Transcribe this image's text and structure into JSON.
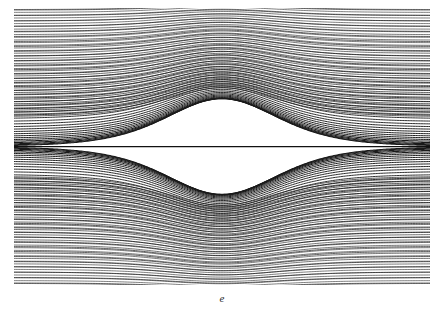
{
  "figure": {
    "caption": "e",
    "kind": "contour-streamline-plot",
    "background_color": "#ffffff",
    "line_color": "#1a1a1a",
    "plot_box": {
      "x": 14,
      "y": 8,
      "width": 416,
      "height": 277
    }
  },
  "chart_data": {
    "type": "line",
    "title": "",
    "subtitle": "",
    "xlabel": "",
    "ylabel": "",
    "annotations": [
      "e"
    ],
    "legend": [],
    "legend_position": "none",
    "grid": false,
    "axis_visible": false,
    "tick_labels_x": [],
    "tick_labels_y": [],
    "xlim": [
      -1,
      1
    ],
    "ylim": [
      -1,
      1
    ],
    "symmetry": [
      "horizontal-mirror-about-y0",
      "vertical-mirror-about-x0"
    ],
    "series_count": 84,
    "separatrix": {
      "type": "straight-horizontal-line",
      "y": 0
    },
    "levels": [
      0.0,
      0.012,
      0.025,
      0.038,
      0.052,
      0.066,
      0.081,
      0.096,
      0.112,
      0.129,
      0.146,
      0.164,
      0.183,
      0.202,
      0.222,
      0.243,
      0.265,
      0.288,
      0.311,
      0.336,
      0.361,
      0.387,
      0.414,
      0.442,
      0.471,
      0.501,
      0.532,
      0.564,
      0.597,
      0.631,
      0.666,
      0.702,
      0.739,
      0.777,
      0.816,
      0.856,
      0.897,
      0.939,
      0.982,
      1.026,
      1.071
    ],
    "hump": {
      "center_x": 0.0,
      "profile": "sech-squared",
      "width": 0.36,
      "max_amplitude": 0.52
    },
    "x": [
      -1.0,
      -0.9,
      -0.8,
      -0.7,
      -0.6,
      -0.5,
      -0.4,
      -0.3,
      -0.2,
      -0.1,
      0.0,
      0.1,
      0.2,
      0.3,
      0.4,
      0.5,
      0.6,
      0.7,
      0.8,
      0.9,
      1.0
    ],
    "series": [
      {
        "name": "level-0",
        "values": [
          0,
          0,
          0,
          0,
          0,
          0,
          0,
          0,
          0,
          0,
          0,
          0,
          0,
          0,
          0,
          0,
          0,
          0,
          0,
          0,
          0
        ]
      },
      {
        "name": "level-1",
        "values": [
          0.09,
          0.09,
          0.09,
          0.09,
          0.1,
          0.1,
          0.11,
          0.13,
          0.16,
          0.2,
          0.22,
          0.2,
          0.16,
          0.13,
          0.11,
          0.1,
          0.1,
          0.09,
          0.09,
          0.09,
          0.09
        ]
      },
      {
        "name": "level-2",
        "values": [
          0.18,
          0.18,
          0.18,
          0.19,
          0.19,
          0.2,
          0.22,
          0.25,
          0.3,
          0.35,
          0.38,
          0.35,
          0.3,
          0.25,
          0.22,
          0.2,
          0.19,
          0.19,
          0.18,
          0.18,
          0.18
        ]
      },
      {
        "name": "level-3",
        "values": [
          0.28,
          0.28,
          0.28,
          0.29,
          0.3,
          0.31,
          0.34,
          0.38,
          0.44,
          0.5,
          0.53,
          0.5,
          0.44,
          0.38,
          0.34,
          0.31,
          0.3,
          0.29,
          0.28,
          0.28,
          0.28
        ]
      },
      {
        "name": "level-4",
        "values": [
          0.4,
          0.4,
          0.41,
          0.41,
          0.42,
          0.44,
          0.47,
          0.52,
          0.58,
          0.64,
          0.67,
          0.64,
          0.58,
          0.52,
          0.47,
          0.44,
          0.42,
          0.41,
          0.41,
          0.4,
          0.4
        ]
      },
      {
        "name": "level-5",
        "values": [
          0.55,
          0.55,
          0.56,
          0.57,
          0.58,
          0.6,
          0.63,
          0.68,
          0.74,
          0.79,
          0.81,
          0.79,
          0.74,
          0.68,
          0.63,
          0.6,
          0.58,
          0.57,
          0.56,
          0.55,
          0.55
        ]
      },
      {
        "name": "level-6",
        "values": [
          0.72,
          0.72,
          0.73,
          0.74,
          0.75,
          0.77,
          0.8,
          0.84,
          0.89,
          0.93,
          0.95,
          0.93,
          0.89,
          0.84,
          0.8,
          0.77,
          0.75,
          0.74,
          0.73,
          0.72,
          0.72
        ]
      },
      {
        "name": "level-7",
        "values": [
          0.88,
          0.88,
          0.89,
          0.9,
          0.91,
          0.93,
          0.95,
          0.98,
          1.0,
          1.0,
          1.0,
          1.0,
          1.0,
          0.98,
          0.95,
          0.93,
          0.91,
          0.9,
          0.89,
          0.88,
          0.88
        ]
      }
    ],
    "mirrored_series_note": "Every listed series is duplicated with negated y values to form the lower half of the figure.",
    "density": {
      "curve_spacing_model": "geometric-crowding-toward-margins",
      "dark_corner_regions": [
        "top-left",
        "top-right",
        "bottom-left",
        "bottom-right"
      ]
    }
  }
}
